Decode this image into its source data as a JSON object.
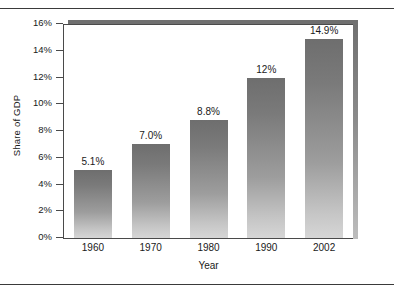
{
  "chart_data": {
    "type": "bar",
    "title": "",
    "subtitle": "",
    "xlabel": "Year",
    "ylabel": "Share of GDP",
    "categories": [
      "1960",
      "1970",
      "1980",
      "1990",
      "2002"
    ],
    "values": [
      5.1,
      7.0,
      8.8,
      12.0,
      14.9
    ],
    "data_labels": [
      "5.1%",
      "7.0%",
      "8.8%",
      "12%",
      "14.9%"
    ],
    "ylim": [
      0,
      16
    ],
    "ytick_values": [
      0,
      2,
      4,
      6,
      8,
      10,
      12,
      14,
      16
    ],
    "ytick_labels": [
      "0%",
      "2%",
      "4%",
      "6%",
      "8%",
      "10%",
      "12%",
      "14%",
      "16%"
    ],
    "grid": false,
    "legend": false,
    "legend_position": "none",
    "series": [
      {
        "name": "Share of GDP",
        "values": [
          5.1,
          7.0,
          8.8,
          12.0,
          14.9
        ]
      }
    ],
    "colors": {
      "bar_top": "#6e6e6e",
      "bar_bottom": "#d6d6d6",
      "axis": "#4a4a4a",
      "shadow": "#6f6f6f",
      "text": "#1a1a1a",
      "rule": "#3a3a3a",
      "background": "#ffffff"
    }
  }
}
